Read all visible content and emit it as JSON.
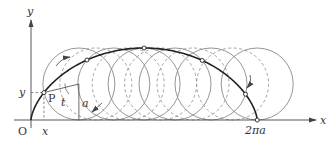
{
  "diagram": {
    "labels": {
      "y_axis": "y",
      "x_axis": "x",
      "origin": "O",
      "point": "P",
      "x_coord": "x",
      "y_coord": "y",
      "angle": "t",
      "radius": "a",
      "end": "2πa"
    },
    "parameters": {
      "point_t": 1.33,
      "solid_circle_t": [
        1.33,
        2.3,
        3.1416,
        4.0,
        5.0,
        6.2832
      ],
      "dashed_circle_t": [
        1.8,
        2.7,
        3.6,
        4.5,
        5.6
      ],
      "marked_point_t": [
        1.33,
        2.3,
        3.1416,
        4.0,
        5.0,
        6.2832
      ],
      "t_max": 6.2832
    },
    "colors": {
      "curve": "#222222",
      "circle": "#8a8a8a",
      "axis": "#444444"
    }
  }
}
